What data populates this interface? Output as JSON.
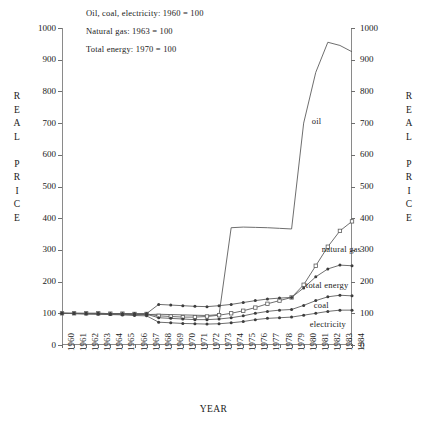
{
  "header": {
    "notes": [
      "Oil, coal, electricity:  1960  =  100",
      "Natural gas:  1963  =  100",
      "Total energy:  1970  =  100"
    ]
  },
  "axis": {
    "y_title_letters": [
      "R",
      "E",
      "A",
      "L",
      "",
      "P",
      "R",
      "I",
      "C",
      "E"
    ],
    "x_title": "YEAR"
  },
  "chart_data": {
    "type": "line",
    "title": "",
    "xlabel": "YEAR",
    "ylabel": "REAL PRICE",
    "xlim": [
      1960,
      1984
    ],
    "ylim": [
      0,
      1000
    ],
    "yticks": [
      0,
      100,
      200,
      300,
      400,
      500,
      600,
      700,
      800,
      900,
      1000
    ],
    "ytick_labels": [
      "0",
      "100",
      "200",
      "300",
      "400",
      "500",
      "600",
      "700",
      "800",
      "900",
      "1000"
    ],
    "grid": false,
    "legend": "inline-labels",
    "x": [
      1960,
      1961,
      1962,
      1963,
      1964,
      1965,
      1966,
      1967,
      1968,
      1969,
      1970,
      1971,
      1972,
      1973,
      1974,
      1975,
      1976,
      1977,
      1978,
      1979,
      1980,
      1981,
      1982,
      1983,
      1984
    ],
    "series": [
      {
        "name": "oil",
        "label": "oil",
        "marker": "none",
        "values": [
          100,
          99,
          98,
          98,
          97,
          97,
          96,
          96,
          97,
          96,
          95,
          94,
          93,
          96,
          370,
          372,
          371,
          370,
          368,
          366,
          700,
          860,
          955,
          945,
          925
        ]
      },
      {
        "name": "natural gas",
        "label": "natural gas",
        "marker": "open-square",
        "values": [
          100,
          100,
          100,
          100,
          99,
          99,
          98,
          98,
          92,
          90,
          88,
          88,
          90,
          94,
          100,
          108,
          118,
          130,
          140,
          150,
          190,
          250,
          310,
          360,
          390
        ]
      },
      {
        "name": "total energy",
        "label": "total energy",
        "marker": "dot",
        "values": [
          100,
          100,
          100,
          100,
          99,
          99,
          99,
          99,
          128,
          126,
          124,
          122,
          121,
          124,
          128,
          134,
          140,
          145,
          148,
          150,
          180,
          215,
          240,
          252,
          250
        ]
      },
      {
        "name": "coal",
        "label": "coal",
        "marker": "dot",
        "values": [
          100,
          100,
          99,
          99,
          98,
          98,
          97,
          97,
          86,
          84,
          82,
          80,
          80,
          82,
          86,
          92,
          100,
          106,
          110,
          112,
          125,
          140,
          152,
          157,
          155
        ]
      },
      {
        "name": "electricity",
        "label": "electricity",
        "marker": "dot",
        "values": [
          100,
          99,
          98,
          97,
          96,
          95,
          93,
          92,
          72,
          70,
          68,
          67,
          66,
          67,
          70,
          74,
          80,
          84,
          86,
          88,
          94,
          100,
          106,
          110,
          110
        ]
      }
    ],
    "annotations": [
      {
        "text": "oil",
        "x": 1982,
        "y": 700
      },
      {
        "text": "natural gas",
        "x": 1982,
        "y": 300
      },
      {
        "text": "total energy",
        "x": 1982,
        "y": 185
      },
      {
        "text": "coal",
        "x": 1982,
        "y": 122
      },
      {
        "text": "electricity",
        "x": 1982,
        "y": 62
      }
    ]
  }
}
